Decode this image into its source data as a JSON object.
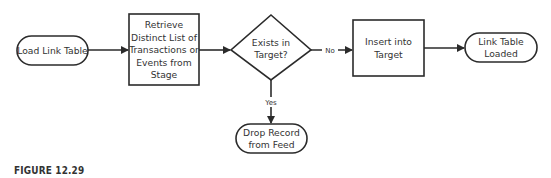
{
  "diagram": {
    "type": "flowchart",
    "nodes": {
      "start": {
        "lines": [
          "Load Link Table"
        ],
        "shape": "terminator"
      },
      "retrieve": {
        "lines": [
          "Retrieve",
          "Distinct List of",
          "Transactions or",
          "Events from",
          "Stage"
        ],
        "shape": "process"
      },
      "decision": {
        "lines": [
          "Exists in",
          "Target?"
        ],
        "shape": "decision"
      },
      "insert": {
        "lines": [
          "Insert into",
          "Target"
        ],
        "shape": "process"
      },
      "end": {
        "lines": [
          "Link Table",
          "Loaded"
        ],
        "shape": "terminator"
      },
      "drop": {
        "lines": [
          "Drop Record",
          "from Feed"
        ],
        "shape": "terminator"
      }
    },
    "edges": [
      {
        "from": "start",
        "to": "retrieve",
        "label": ""
      },
      {
        "from": "retrieve",
        "to": "decision",
        "label": ""
      },
      {
        "from": "decision",
        "to": "insert",
        "label": "No"
      },
      {
        "from": "insert",
        "to": "end",
        "label": ""
      },
      {
        "from": "decision",
        "to": "drop",
        "label": "Yes"
      }
    ],
    "labels": {
      "no": "No",
      "yes": "Yes"
    }
  },
  "caption": "FIGURE 12.29",
  "colors": {
    "stroke": "#2b2b2b",
    "text": "#333333",
    "background": "#ffffff"
  }
}
